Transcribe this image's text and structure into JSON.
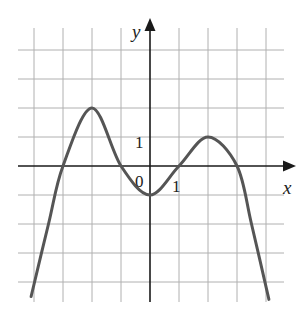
{
  "chart_data": {
    "type": "line",
    "title": "",
    "xlabel": "x",
    "ylabel": "y",
    "tick_labels": {
      "origin": "0",
      "x_unit": "1",
      "y_unit": "1"
    },
    "grid": true,
    "xlim": [
      -4.5,
      4.7
    ],
    "ylim": [
      -4.6,
      4.0
    ],
    "grid_step": 1,
    "series": [
      {
        "name": "f(x)",
        "color": "#555555",
        "points": [
          {
            "x": -4.1,
            "y": -4.5
          },
          {
            "x": -3.5,
            "y": -2.0
          },
          {
            "x": -3.0,
            "y": 0
          },
          {
            "x": -2.0,
            "y": 2.0
          },
          {
            "x": -1.0,
            "y": 0
          },
          {
            "x": 0.0,
            "y": -1.0
          },
          {
            "x": 1.0,
            "y": 0
          },
          {
            "x": 2.0,
            "y": 1.0
          },
          {
            "x": 3.0,
            "y": 0
          },
          {
            "x": 3.5,
            "y": -2.0
          },
          {
            "x": 4.1,
            "y": -4.6
          }
        ]
      }
    ],
    "annotations": [
      {
        "text": "0",
        "position": "below-left of origin"
      },
      {
        "text": "1",
        "position": "x-axis tick at x=1"
      },
      {
        "text": "1",
        "position": "y-axis tick at y=1"
      }
    ]
  },
  "colors": {
    "curve": "#555555",
    "grid": "#b0b0b0",
    "axis": "#1a1a1a",
    "background": "#ffffff"
  }
}
